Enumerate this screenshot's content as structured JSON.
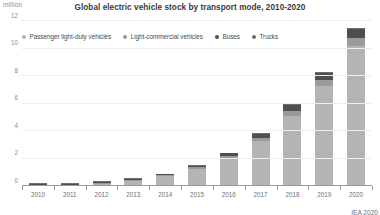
{
  "chart_data": {
    "type": "bar",
    "stacked": true,
    "title": "Global electric vehicle stock by transport mode, 2010-2020",
    "unit_label": "million",
    "xlabel": "",
    "ylabel": "",
    "ylim": [
      0,
      12
    ],
    "yticks": [
      0,
      2,
      4,
      6,
      8,
      10,
      12
    ],
    "ytick_labels": [
      "0",
      "2",
      "4",
      "6",
      "8",
      "10",
      "12"
    ],
    "grid": true,
    "legend_position": "top-left",
    "categories": [
      "2010",
      "2011",
      "2012",
      "2013",
      "2014",
      "2015",
      "2016",
      "2017",
      "2018",
      "2019",
      "2020"
    ],
    "series": [
      {
        "name": "Passenger light-duty vehicles",
        "color": "#b4b4b4",
        "values": [
          0.017,
          0.06,
          0.18,
          0.4,
          0.72,
          1.25,
          2.02,
          3.26,
          5.12,
          7.25,
          10.2
        ]
      },
      {
        "name": "Light-commercial vehicles",
        "color": "#9a9a9a",
        "values": [
          0.001,
          0.005,
          0.02,
          0.04,
          0.06,
          0.1,
          0.15,
          0.22,
          0.33,
          0.45,
          0.6
        ]
      },
      {
        "name": "Buses",
        "color": "#4f4f4f",
        "values": [
          0.0005,
          0.003,
          0.01,
          0.03,
          0.06,
          0.11,
          0.2,
          0.33,
          0.45,
          0.52,
          0.6
        ]
      },
      {
        "name": "Trucks",
        "color": "#6e6e6e",
        "values": [
          0.0002,
          0.001,
          0.003,
          0.006,
          0.01,
          0.02,
          0.03,
          0.05,
          0.07,
          0.09,
          0.12
        ]
      }
    ],
    "totals": [
      0.019,
      0.069,
      0.213,
      0.476,
      0.85,
      1.48,
      2.4,
      3.86,
      5.97,
      8.31,
      11.52
    ],
    "annotations": []
  },
  "source": {
    "text": "IEA 2020"
  }
}
